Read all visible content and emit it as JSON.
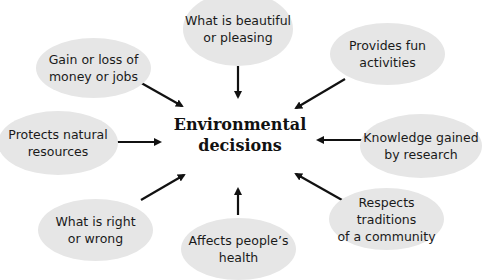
{
  "center": {
    "label": "Environmental\ndecisions"
  },
  "nodes": [
    {
      "id": "beauty",
      "label": "What is beautiful\nor pleasing"
    },
    {
      "id": "money",
      "label": "Gain or loss of\nmoney or jobs"
    },
    {
      "id": "fun",
      "label": "Provides fun\nactivities"
    },
    {
      "id": "nature",
      "label": "Protects natural\nresources"
    },
    {
      "id": "knowledge",
      "label": "Knowledge gained\nby research"
    },
    {
      "id": "ethics",
      "label": "What is right\nor wrong"
    },
    {
      "id": "health",
      "label": "Affects people’s\nhealth"
    },
    {
      "id": "traditions",
      "label": "Respects traditions\nof a community"
    }
  ],
  "colors": {
    "node_fill": "#e6e6e6",
    "arrow": "#111111",
    "text": "#1a1a1a"
  }
}
